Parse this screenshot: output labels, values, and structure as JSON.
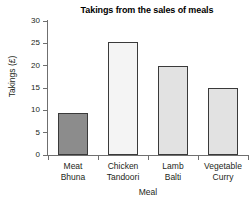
{
  "chart_data": {
    "type": "bar",
    "title": "Takings from the sales of meals",
    "xlabel": "Meal",
    "ylabel": "Takings (£)",
    "categories": [
      "Meat Bhuna",
      "Chicken Tandoori",
      "Lamb Balti",
      "Vegetable Curry"
    ],
    "category_lines": [
      [
        "Meat",
        "Bhuna"
      ],
      [
        "Chicken",
        "Tandoori"
      ],
      [
        "Lamb",
        "Balti"
      ],
      [
        "Vegetable",
        "Curry"
      ]
    ],
    "values": [
      9.3,
      25.2,
      20,
      15
    ],
    "bar_colors": [
      "#8c8c8c",
      "#f4f4f4",
      "#e2e2e2",
      "#e2e2e2"
    ],
    "bar_border_color": "#3a3a3a",
    "ylim": [
      0,
      30
    ],
    "ytick_values": [
      0,
      5,
      10,
      15,
      20,
      25,
      30
    ],
    "ytick_labels": [
      "0",
      "5",
      "10",
      "15",
      "20",
      "25",
      "30"
    ],
    "grid": false,
    "legend": false,
    "axis_color": "#6f6f6f"
  }
}
